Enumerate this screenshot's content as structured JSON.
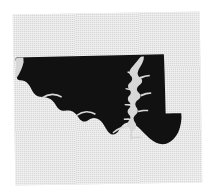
{
  "figure": {
    "kind": "state-silhouette-map",
    "caption": "",
    "background_color": "#ffffff",
    "paper_color": "#d7d7d7",
    "land_color": "#111111",
    "water_color": "#d7d7d7",
    "rotation_degrees": -0.9,
    "has_labels": false,
    "has_legend": false,
    "has_scale_bar": false,
    "has_border_frame": false,
    "visible_text": ""
  },
  "map": {
    "outline_name": "maryland-outline",
    "water_body_name": "chesapeake-bay",
    "features": [
      {
        "name": "western-panhandle",
        "rendered": true
      },
      {
        "name": "mason-dixon-northern-border",
        "rendered": true
      },
      {
        "name": "potomac-river-southern-border",
        "rendered": true
      },
      {
        "name": "delaware-eastern-border",
        "rendered": true
      },
      {
        "name": "chesapeake-bay",
        "rendered": true
      },
      {
        "name": "eastern-shore",
        "rendered": true
      },
      {
        "name": "southern-maryland-peninsula",
        "rendered": true
      },
      {
        "name": "atlantic-coast",
        "rendered": true
      }
    ]
  },
  "paper_panel": {
    "left": 14,
    "top": 13,
    "width": 187,
    "height": 171
  }
}
